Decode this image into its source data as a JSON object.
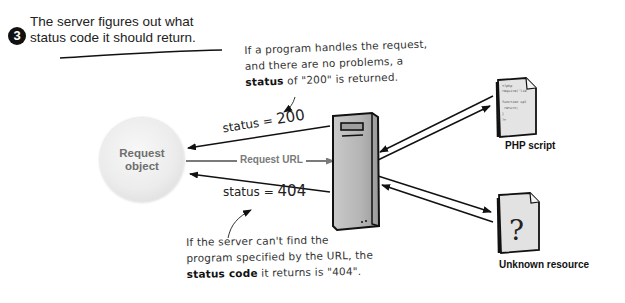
{
  "step": {
    "number": "3",
    "title_line1": "The server figures out what",
    "title_line2": "status code it should return."
  },
  "notes": {
    "top": {
      "line1": "If a program handles the request,",
      "line2": "and there are no problems, a",
      "line3_bold": "status",
      "line3_rest": " of \"200\" is returned."
    },
    "bottom": {
      "line1": "If the server can't find the",
      "line2": "program specified by the URL, the",
      "line3_bold": "status code",
      "line3_rest": " it returns is \"404\"."
    }
  },
  "labels": {
    "status_200_prefix": "status = ",
    "status_200_value": "200",
    "status_404_prefix": "status = ",
    "status_404_value": "404",
    "request_url": "Request URL",
    "request_object_line1": "Request",
    "request_object_line2": "object",
    "php_script": "PHP script",
    "unknown_resource": "Unknown resource"
  },
  "icons": {
    "server": "server-tower-icon",
    "php_doc": "document-code-icon",
    "unknown_doc": "document-question-icon",
    "unknown_glyph": "?"
  },
  "php_doc_code": [
    "<?php",
    "require('lib.php');",
    "",
    "function upload(){",
    "  return;",
    "}",
    "?>"
  ],
  "colors": {
    "ink": "#111111",
    "gray_label": "#6e6e6e",
    "server_fill": "#b9b9b9",
    "doc_fill": "#e4e4e4",
    "request_circle": "#ececec"
  }
}
